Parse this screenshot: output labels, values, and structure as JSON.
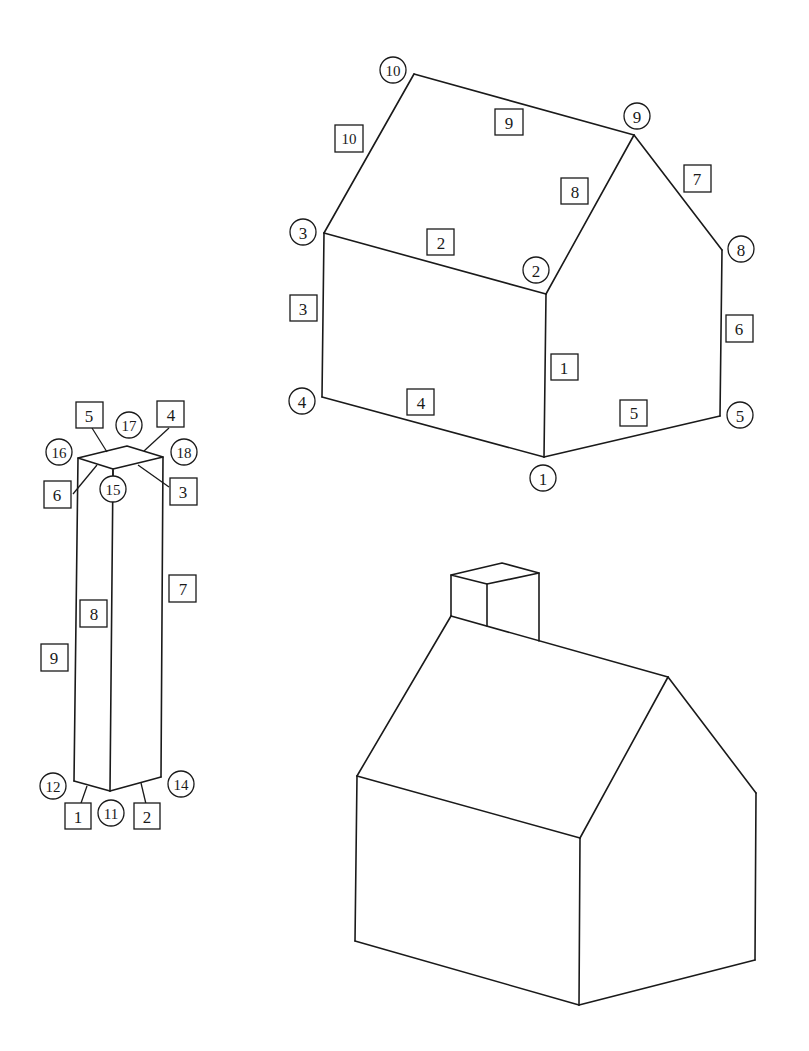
{
  "figures": {
    "labeled_house": {
      "vertices": [
        {
          "id": "1",
          "x": 543,
          "y": 478
        },
        {
          "id": "2",
          "x": 536,
          "y": 270
        },
        {
          "id": "3",
          "x": 303,
          "y": 232
        },
        {
          "id": "4",
          "x": 302,
          "y": 401
        },
        {
          "id": "5",
          "x": 740,
          "y": 415
        },
        {
          "id": "8",
          "x": 741,
          "y": 249
        },
        {
          "id": "9",
          "x": 637,
          "y": 116
        },
        {
          "id": "10",
          "x": 393,
          "y": 70
        }
      ],
      "edges": [
        {
          "id": "1",
          "x": 564,
          "y": 367
        },
        {
          "id": "2",
          "x": 441,
          "y": 243
        },
        {
          "id": "3",
          "x": 303,
          "y": 308
        },
        {
          "id": "4",
          "x": 421,
          "y": 403
        },
        {
          "id": "5",
          "x": 634,
          "y": 412
        },
        {
          "id": "6",
          "x": 739,
          "y": 329
        },
        {
          "id": "7",
          "x": 697,
          "y": 178
        },
        {
          "id": "8",
          "x": 575,
          "y": 191
        },
        {
          "id": "9",
          "x": 509,
          "y": 122
        },
        {
          "id": "10",
          "x": 349,
          "y": 139
        }
      ]
    },
    "labeled_chimney": {
      "vertices": [
        {
          "id": "11",
          "x": 111,
          "y": 813
        },
        {
          "id": "12",
          "x": 53,
          "y": 786
        },
        {
          "id": "14",
          "x": 181,
          "y": 784
        },
        {
          "id": "15",
          "x": 113,
          "y": 489
        },
        {
          "id": "16",
          "x": 59,
          "y": 452
        },
        {
          "id": "17",
          "x": 129,
          "y": 425
        },
        {
          "id": "18",
          "x": 184,
          "y": 452
        }
      ],
      "edges": [
        {
          "id": "1",
          "x": 78,
          "y": 816
        },
        {
          "id": "2",
          "x": 147,
          "y": 816
        },
        {
          "id": "3",
          "x": 183,
          "y": 492
        },
        {
          "id": "4",
          "x": 171,
          "y": 414
        },
        {
          "id": "5",
          "x": 89,
          "y": 415
        },
        {
          "id": "6",
          "x": 57,
          "y": 494
        },
        {
          "id": "7",
          "x": 183,
          "y": 588
        },
        {
          "id": "8",
          "x": 94,
          "y": 613
        },
        {
          "id": "9",
          "x": 54,
          "y": 657
        }
      ]
    },
    "combined_house": {
      "label": ""
    }
  }
}
